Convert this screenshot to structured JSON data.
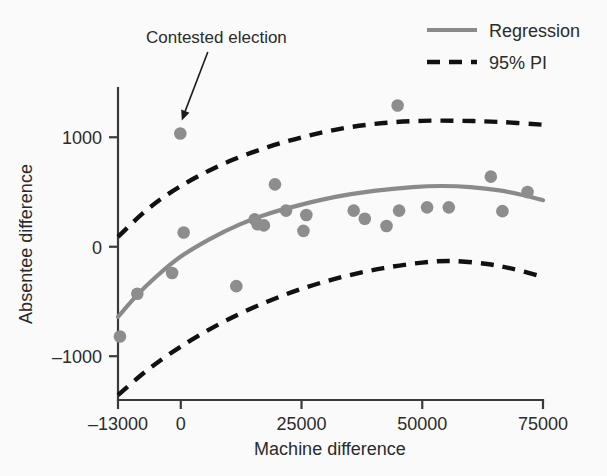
{
  "chart_data": {
    "type": "scatter",
    "title": "",
    "xlabel": "Machine difference",
    "ylabel": "Absentee difference",
    "xlim": [
      -13000,
      75000
    ],
    "ylim": [
      -1400,
      1450
    ],
    "grid": false,
    "legend_position": "top-right",
    "xticks": [
      -13000,
      0,
      25000,
      50000,
      75000
    ],
    "xtick_labels": [
      "–13000",
      "0",
      "25000",
      "50000",
      "75000"
    ],
    "yticks": [
      1000,
      0,
      -1000
    ],
    "ytick_labels": [
      "1000",
      "0",
      "–1000"
    ],
    "legend": [
      {
        "label": "Regression",
        "style": "solid",
        "color": "#8a8a8a"
      },
      {
        "label": "95% PI",
        "style": "dashed",
        "color": "#111111"
      }
    ],
    "annotations": [
      {
        "text": "Contested election",
        "target_x": 0,
        "target_y": 1035,
        "label_x": -6000,
        "label_y": 1700
      }
    ],
    "series": [
      {
        "name": "Observations",
        "type": "scatter",
        "color": "#8d8d8d",
        "marker": "circle",
        "points": [
          {
            "x": -12600,
            "y": -820
          },
          {
            "x": -9000,
            "y": -430
          },
          {
            "x": -1800,
            "y": -240
          },
          {
            "x": -100,
            "y": 1035
          },
          {
            "x": 600,
            "y": 130
          },
          {
            "x": 11500,
            "y": -360
          },
          {
            "x": 15300,
            "y": 250
          },
          {
            "x": 15900,
            "y": 205
          },
          {
            "x": 17200,
            "y": 195
          },
          {
            "x": 19500,
            "y": 570
          },
          {
            "x": 21800,
            "y": 330
          },
          {
            "x": 25400,
            "y": 145
          },
          {
            "x": 26000,
            "y": 290
          },
          {
            "x": 35800,
            "y": 330
          },
          {
            "x": 38100,
            "y": 255
          },
          {
            "x": 42600,
            "y": 190
          },
          {
            "x": 44900,
            "y": 1290
          },
          {
            "x": 45200,
            "y": 330
          },
          {
            "x": 51000,
            "y": 360
          },
          {
            "x": 55500,
            "y": 360
          },
          {
            "x": 64200,
            "y": 640
          },
          {
            "x": 66600,
            "y": 325
          },
          {
            "x": 71800,
            "y": 500
          }
        ]
      },
      {
        "name": "Regression",
        "type": "line",
        "color": "#8a8a8a",
        "style": "solid",
        "points": [
          {
            "x": -13000,
            "y": -640
          },
          {
            "x": -9000,
            "y": -440
          },
          {
            "x": -5000,
            "y": -270
          },
          {
            "x": 0,
            "y": -90
          },
          {
            "x": 6000,
            "y": 70
          },
          {
            "x": 12000,
            "y": 200
          },
          {
            "x": 18000,
            "y": 300
          },
          {
            "x": 25000,
            "y": 385
          },
          {
            "x": 32000,
            "y": 455
          },
          {
            "x": 40000,
            "y": 510
          },
          {
            "x": 48000,
            "y": 545
          },
          {
            "x": 54000,
            "y": 555
          },
          {
            "x": 60000,
            "y": 545
          },
          {
            "x": 66000,
            "y": 515
          },
          {
            "x": 71000,
            "y": 470
          },
          {
            "x": 75000,
            "y": 425
          }
        ]
      },
      {
        "name": "95% PI upper",
        "type": "line",
        "color": "#111111",
        "style": "dashed",
        "points": [
          {
            "x": -13000,
            "y": 90
          },
          {
            "x": -8000,
            "y": 300
          },
          {
            "x": -3000,
            "y": 470
          },
          {
            "x": 3000,
            "y": 630
          },
          {
            "x": 10000,
            "y": 780
          },
          {
            "x": 18000,
            "y": 910
          },
          {
            "x": 26000,
            "y": 1010
          },
          {
            "x": 34000,
            "y": 1085
          },
          {
            "x": 42000,
            "y": 1130
          },
          {
            "x": 50000,
            "y": 1150
          },
          {
            "x": 58000,
            "y": 1150
          },
          {
            "x": 66000,
            "y": 1140
          },
          {
            "x": 75000,
            "y": 1115
          }
        ]
      },
      {
        "name": "95% PI lower",
        "type": "line",
        "color": "#111111",
        "style": "dashed",
        "points": [
          {
            "x": -13000,
            "y": -1355
          },
          {
            "x": -8000,
            "y": -1165
          },
          {
            "x": -3000,
            "y": -1000
          },
          {
            "x": 3000,
            "y": -830
          },
          {
            "x": 10000,
            "y": -660
          },
          {
            "x": 18000,
            "y": -500
          },
          {
            "x": 26000,
            "y": -370
          },
          {
            "x": 34000,
            "y": -270
          },
          {
            "x": 42000,
            "y": -195
          },
          {
            "x": 50000,
            "y": -145
          },
          {
            "x": 56000,
            "y": -130
          },
          {
            "x": 63000,
            "y": -155
          },
          {
            "x": 69000,
            "y": -205
          },
          {
            "x": 75000,
            "y": -275
          }
        ]
      }
    ]
  },
  "figure": {
    "background_color": "#fafafa",
    "axis_color": "#3a3a3a"
  }
}
